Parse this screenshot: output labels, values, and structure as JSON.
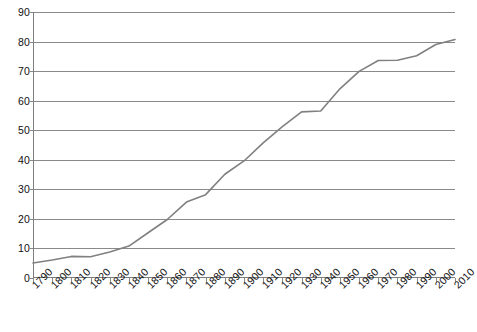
{
  "chart_data": {
    "type": "line",
    "title": "",
    "subtitle": "",
    "xlabel": "",
    "ylabel": "",
    "x": [
      1790,
      1800,
      1810,
      1820,
      1830,
      1840,
      1850,
      1860,
      1870,
      1880,
      1890,
      1900,
      1910,
      1920,
      1930,
      1940,
      1950,
      1960,
      1970,
      1980,
      1990,
      2000,
      2010
    ],
    "values": [
      5.1,
      6.1,
      7.3,
      7.2,
      8.8,
      10.8,
      15.3,
      19.8,
      25.7,
      28.2,
      35.1,
      39.6,
      45.7,
      51.2,
      56.2,
      56.5,
      64.0,
      69.9,
      73.6,
      73.7,
      75.2,
      79.0,
      80.7
    ],
    "series": [
      {
        "name": "",
        "values": [
          5.1,
          6.1,
          7.3,
          7.2,
          8.8,
          10.8,
          15.3,
          19.8,
          25.7,
          28.2,
          35.1,
          39.6,
          45.7,
          51.2,
          56.2,
          56.5,
          64.0,
          69.9,
          73.6,
          73.7,
          75.2,
          79.0,
          80.7
        ]
      }
    ],
    "xlim": [
      1790,
      2010
    ],
    "ylim": [
      0,
      90
    ],
    "y_ticks": [
      0,
      10,
      20,
      30,
      40,
      50,
      60,
      70,
      80,
      90
    ],
    "x_ticks": [
      1790,
      1800,
      1810,
      1820,
      1830,
      1840,
      1850,
      1860,
      1870,
      1880,
      1890,
      1900,
      1910,
      1920,
      1930,
      1940,
      1950,
      1960,
      1970,
      1980,
      1990,
      2000,
      2010
    ],
    "x_tick_labels": [
      "1790",
      "1800",
      "1810",
      "1820",
      "1830",
      "1840",
      "1850",
      "1860",
      "1870",
      "1880",
      "1890",
      "1900",
      "1910",
      "1920",
      "1930",
      "1940",
      "1950",
      "1960",
      "1970",
      "1980",
      "1990",
      "2000",
      "2010"
    ],
    "y_tick_labels": [
      "0",
      "10",
      "20",
      "30",
      "40",
      "50",
      "60",
      "70",
      "80",
      "90"
    ],
    "grid": true,
    "grid_axis": "y",
    "legend": false,
    "legend_position": "none",
    "annotations": [],
    "line_color": "#808080",
    "grid_color": "#8a8a8a",
    "axis_color": "#7d7d7d",
    "background_color": "#ffffff",
    "text_color": "#111111"
  }
}
